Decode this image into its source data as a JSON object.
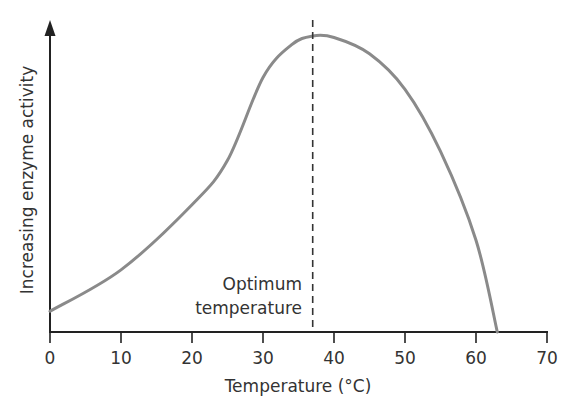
{
  "chart_data": {
    "type": "line",
    "title": "",
    "xlabel": "Temperature (°C)",
    "ylabel": "Increasing enzyme activity",
    "xlim": [
      0,
      70
    ],
    "ylim": [
      0,
      100
    ],
    "xticks": [
      0,
      10,
      20,
      30,
      40,
      50,
      60,
      70
    ],
    "xtick_labels": [
      "0",
      "10",
      "20",
      "30",
      "40",
      "50",
      "60",
      "70"
    ],
    "yticks": [],
    "grid": false,
    "legend": null,
    "series": [
      {
        "name": "Enzyme activity",
        "color": "#8a8a8a",
        "x": [
          0,
          10,
          20,
          25,
          30,
          34,
          37,
          40,
          45,
          50,
          55,
          60,
          63
        ],
        "y": [
          7,
          21,
          43,
          58,
          86,
          97,
          100,
          99.5,
          94,
          82,
          61,
          31,
          0
        ]
      }
    ],
    "annotations": [
      {
        "type": "vline",
        "x": 37,
        "style": "dashed",
        "color": "#333333",
        "label_lines": [
          "Optimum",
          "temperature"
        ]
      }
    ]
  },
  "labels": {
    "ylabel": "Increasing enzyme activity",
    "xlabel": "Temperature (°C)",
    "annotation_line1": "Optimum",
    "annotation_line2": "temperature",
    "ticks": [
      "0",
      "10",
      "20",
      "30",
      "40",
      "50",
      "60",
      "70"
    ]
  }
}
